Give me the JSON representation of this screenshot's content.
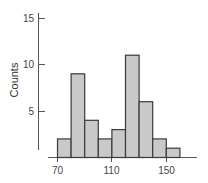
{
  "chart_data": {
    "type": "bar",
    "subtype": "histogram",
    "title": "",
    "xlabel": "",
    "ylabel": "Counts",
    "bin_width": 10,
    "bins": [
      {
        "start": 70,
        "end": 80,
        "count": 2
      },
      {
        "start": 80,
        "end": 90,
        "count": 9
      },
      {
        "start": 90,
        "end": 100,
        "count": 4
      },
      {
        "start": 100,
        "end": 110,
        "count": 2
      },
      {
        "start": 110,
        "end": 120,
        "count": 3
      },
      {
        "start": 120,
        "end": 130,
        "count": 11
      },
      {
        "start": 130,
        "end": 140,
        "count": 6
      },
      {
        "start": 140,
        "end": 150,
        "count": 2
      },
      {
        "start": 150,
        "end": 160,
        "count": 1
      }
    ],
    "categories": [
      "70-80",
      "80-90",
      "90-100",
      "100-110",
      "110-120",
      "120-130",
      "130-140",
      "140-150",
      "150-160"
    ],
    "values": [
      2,
      9,
      4,
      2,
      3,
      11,
      6,
      2,
      1
    ],
    "x_ticks": [
      70,
      110,
      150
    ],
    "y_ticks": [
      5,
      10,
      15
    ],
    "xlim": [
      63,
      166
    ],
    "ylim": [
      0,
      15
    ],
    "grid": false,
    "legend": null,
    "colors": {
      "bar_fill": "#c9c9c9",
      "bar_stroke": "#3a3a3a",
      "axis": "#555555"
    }
  },
  "labels": {
    "ylabel": "Counts",
    "y_ticks": [
      "15",
      "10",
      "5"
    ],
    "x_ticks": [
      "70",
      "110",
      "150"
    ]
  }
}
